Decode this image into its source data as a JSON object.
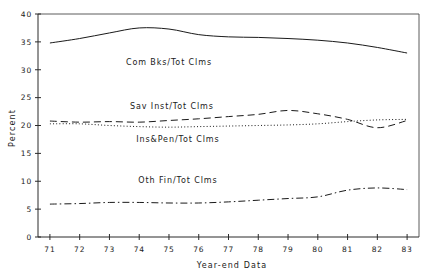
{
  "chart_data": {
    "type": "line",
    "title": "",
    "xlabel": "Year-end Data",
    "ylabel": "Percent",
    "x": [
      71,
      72,
      73,
      74,
      75,
      76,
      77,
      78,
      79,
      80,
      81,
      82,
      83
    ],
    "xtick_labels": [
      "71",
      "72",
      "73",
      "74",
      "75",
      "76",
      "77",
      "78",
      "79",
      "80",
      "81",
      "82",
      "83"
    ],
    "ytick_labels": [
      "0",
      "5",
      "10",
      "15",
      "20",
      "25",
      "30",
      "35",
      "40"
    ],
    "ytick_values": [
      0,
      5,
      10,
      15,
      20,
      25,
      30,
      35,
      40
    ],
    "xlim": [
      70.6,
      83.4
    ],
    "ylim": [
      0,
      40
    ],
    "grid": false,
    "legend_position": "inline-annotations",
    "series": [
      {
        "name": "Com Bks/Tot Clms",
        "label": "Com Bks/Tot Clms",
        "style": "solid",
        "values": [
          34.8,
          35.6,
          36.6,
          37.5,
          37.3,
          36.3,
          35.9,
          35.8,
          35.6,
          35.3,
          34.8,
          34.0,
          33.0
        ],
        "label_x": 75.0,
        "label_y": 30.9
      },
      {
        "name": "Sav Inst/Tot Clms",
        "label": "Sav Inst/Tot Clms",
        "style": "dashed",
        "values": [
          20.8,
          20.6,
          20.7,
          20.6,
          20.9,
          21.2,
          21.6,
          22.0,
          22.7,
          22.1,
          21.1,
          19.6,
          20.9
        ],
        "label_x": 75.1,
        "label_y": 23.0
      },
      {
        "name": "Ins&Pen/Tot Clms",
        "label": "Ins&Pen/Tot Clms",
        "style": "dotted",
        "values": [
          20.3,
          20.3,
          20.0,
          19.8,
          19.7,
          19.8,
          19.9,
          20.0,
          20.1,
          20.3,
          20.7,
          21.0,
          21.1
        ],
        "label_x": 75.3,
        "label_y": 17.0
      },
      {
        "name": "Oth Fin/Tot Clms",
        "label": "Oth Fin/Tot Clms",
        "style": "dash-dot",
        "values": [
          5.9,
          6.0,
          6.2,
          6.2,
          6.1,
          6.1,
          6.3,
          6.6,
          6.9,
          7.2,
          8.4,
          8.8,
          8.5
        ],
        "label_x": 75.3,
        "label_y": 9.6
      }
    ]
  },
  "colors": {
    "background": "#ffffff",
    "axis": "#2b2b2b",
    "series": "#1a1a1a"
  }
}
